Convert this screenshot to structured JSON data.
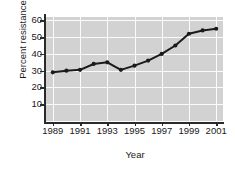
{
  "chart_data": {
    "type": "line",
    "title": "",
    "xlabel": "Year",
    "ylabel": "Percent resistance",
    "x": [
      1989,
      1990,
      1991,
      1992,
      1993,
      1994,
      1995,
      1996,
      1997,
      1998,
      1999,
      2000,
      2001
    ],
    "values": [
      29,
      30,
      30.5,
      34,
      35,
      30.5,
      33,
      36,
      40,
      45,
      52,
      54,
      55
    ],
    "series": [
      {
        "name": "Percent resistance",
        "values": [
          29,
          30,
          30.5,
          34,
          35,
          30.5,
          33,
          36,
          40,
          45,
          52,
          54,
          55
        ]
      }
    ],
    "xlim": [
      1988.5,
      2001.5
    ],
    "ylim": [
      0,
      62
    ],
    "ytick_labels": [
      "60",
      "50",
      "40",
      "30",
      "20",
      "10"
    ],
    "ytick_values": [
      60,
      50,
      40,
      30,
      20,
      10
    ],
    "xtick_labels": [
      "1989",
      "1991",
      "1993",
      "1995",
      "1997",
      "1999",
      "2001"
    ],
    "xtick_values": [
      1989,
      1991,
      1993,
      1995,
      1997,
      1999,
      2001
    ],
    "grid": true,
    "legend": null,
    "legend_position": "none",
    "colors": {
      "plot_background": "#d2d2d2",
      "gridline": "#fbfbfb",
      "line": "#1a1a1a",
      "marker": "#1a1a1a",
      "axis": "#2a2a2a",
      "text": "#1a1a1a",
      "figure_background": "#ffffff"
    },
    "marker": "circle",
    "line_width": 2
  }
}
